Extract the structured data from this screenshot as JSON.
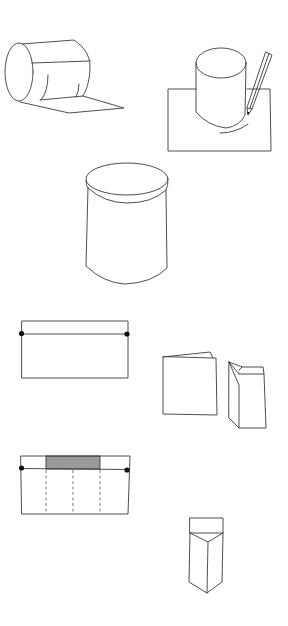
{
  "diagram": {
    "title": "",
    "background": "#ffffff",
    "line_color": "#3a3a3a",
    "shade_color": "#9a9a9a",
    "figures": [
      {
        "id": 1,
        "name": "paper-rolled-into-cylinder",
        "description": "Sheet of paper rolled into a cylinder, tail of sheet lying flat"
      },
      {
        "id": 2,
        "name": "trace-cylinder-on-paper",
        "description": "Cylinder standing on a sheet of paper, pencil tracing its base"
      },
      {
        "id": 3,
        "name": "cylindrical-container-with-lid",
        "description": "Finished cylindrical container with lid"
      },
      {
        "id": 4,
        "name": "paper-strip-with-fold-line",
        "description": "Rectangle with fold line near top and two dot markers"
      },
      {
        "id": 5,
        "name": "folded-card-and-column",
        "description": "Folded card and folded rectangular column"
      },
      {
        "id": 6,
        "name": "strip-with-shaded-tab-and-dashed-folds",
        "description": "Rectangle with shaded tab, three dashed fold lines and two dot markers"
      },
      {
        "id": 7,
        "name": "triangular-prism-box",
        "description": "Triangular prism box with top flap"
      }
    ]
  }
}
